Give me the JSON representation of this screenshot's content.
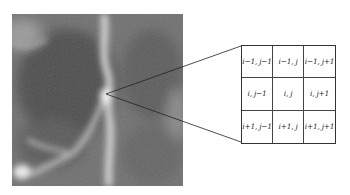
{
  "figure": {
    "colors": {
      "line": "#222222",
      "grid_border": "#333333",
      "background": "#ffffff"
    }
  },
  "neighborhood": {
    "rows": [
      [
        "i−1, j−1",
        "i−1, j",
        "i−1, j+1"
      ],
      [
        "i, j−1",
        "i, j",
        "i, j+1"
      ],
      [
        "i+1, j−1",
        "i+1, j",
        "i+1, j+1"
      ]
    ]
  }
}
